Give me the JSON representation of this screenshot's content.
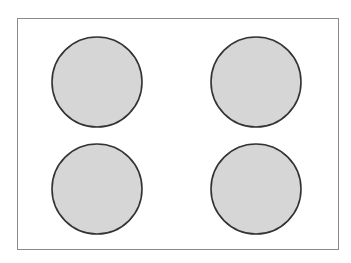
{
  "canvas": {
    "width": 351,
    "height": 263,
    "background": "#ffffff"
  },
  "frame": {
    "x": 17.5,
    "y": 18.5,
    "width": 321,
    "height": 231,
    "stroke": "#8a8a8a",
    "stroke_width": 1
  },
  "circles": [
    {
      "id": "top-left",
      "cx": 97,
      "cy": 82,
      "r": 45,
      "fill": "#d6d6d6",
      "stroke": "#333333"
    },
    {
      "id": "top-right",
      "cx": 256,
      "cy": 82,
      "r": 45,
      "fill": "#d6d6d6",
      "stroke": "#333333"
    },
    {
      "id": "bottom-left",
      "cx": 97,
      "cy": 189,
      "r": 45,
      "fill": "#d6d6d6",
      "stroke": "#333333"
    },
    {
      "id": "bottom-right",
      "cx": 256,
      "cy": 189,
      "r": 45,
      "fill": "#d6d6d6",
      "stroke": "#333333"
    }
  ]
}
